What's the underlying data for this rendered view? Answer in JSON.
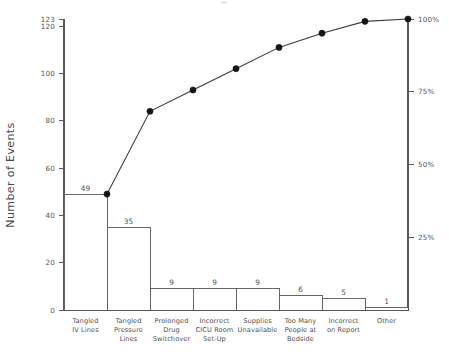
{
  "chart_data": {
    "type": "bar",
    "title": "",
    "subtitle": "",
    "xlabel": "",
    "ylabel": "Number of Events",
    "y2label": "",
    "categories": [
      "Tangled IV Lines",
      "Tangled Pressure Lines",
      "Prolonged Drug Switchover",
      "Incorrect CICU Room Set-Up",
      "Supplies Unavailable",
      "Too Many People at Bedside",
      "Incorrect on Report",
      "Other"
    ],
    "category_lines": [
      [
        "Tangled",
        "IV Lines"
      ],
      [
        "Tangled",
        "Pressure",
        "Lines"
      ],
      [
        "Prolonged",
        "Drug",
        "Switchover"
      ],
      [
        "Incorrect",
        "CICU Room",
        "Set-Up"
      ],
      [
        "Supplies",
        "Unavailable"
      ],
      [
        "Too Many",
        "People at",
        "Bedside"
      ],
      [
        "Incorrect",
        "on Report"
      ],
      [
        "Other"
      ]
    ],
    "values": [
      49,
      35,
      9,
      9,
      9,
      6,
      5,
      1
    ],
    "bar_value_labels": [
      "49",
      "35",
      "9",
      "9",
      "9",
      "6",
      "5",
      "1"
    ],
    "cumulative_values": [
      49,
      84,
      93,
      102,
      111,
      117,
      122,
      123
    ],
    "cumulative_percent": [
      39.8,
      68.3,
      75.6,
      82.9,
      90.2,
      95.1,
      99.2,
      100.0
    ],
    "total": 123,
    "ylim": [
      0,
      123
    ],
    "y_ticks": [
      0,
      20,
      40,
      60,
      80,
      100,
      120,
      123
    ],
    "y_tick_labels": [
      "0",
      "20",
      "40",
      "60",
      "80",
      "100",
      "120",
      "123"
    ],
    "y2lim": [
      0,
      100
    ],
    "y2_ticks": [
      25,
      50,
      75,
      100
    ],
    "y2_tick_labels": [
      "25%",
      "50%",
      "75%",
      "100%"
    ],
    "grid": false,
    "legend": "none",
    "series": [
      {
        "name": "Number of Events",
        "type": "bar",
        "values": [
          49,
          35,
          9,
          9,
          9,
          6,
          5,
          1
        ]
      },
      {
        "name": "Cumulative Percent",
        "type": "line",
        "values": [
          39.8,
          68.3,
          75.6,
          82.9,
          90.2,
          95.1,
          99.2,
          100.0
        ]
      }
    ],
    "colors": {
      "bar_fill": "#ffffff",
      "bar_stroke": "#555555",
      "line": "#3a3a3a",
      "marker": "#161616",
      "axis": "#5a5a5a",
      "text": "#4f4f4f"
    }
  },
  "axes": {
    "left_title": "Number of Events",
    "left_ticks": [
      {
        "label": "123",
        "value": 123
      },
      {
        "label": "120",
        "value": 120
      },
      {
        "label": "100",
        "value": 100
      },
      {
        "label": "80",
        "value": 80
      },
      {
        "label": "60",
        "value": 60
      },
      {
        "label": "40",
        "value": 40
      },
      {
        "label": "20",
        "value": 20
      },
      {
        "label": "0",
        "value": 0
      }
    ],
    "right_ticks": [
      {
        "label": "100%",
        "value": 100
      },
      {
        "label": "75%",
        "value": 75
      },
      {
        "label": "50%",
        "value": 50
      },
      {
        "label": "25%",
        "value": 25
      }
    ]
  },
  "bars": [
    {
      "label": "49",
      "value": 49,
      "cum": 49,
      "cum_pct": 39.8,
      "lines": [
        "Tangled",
        "IV Lines"
      ]
    },
    {
      "label": "35",
      "value": 35,
      "cum": 84,
      "cum_pct": 68.3,
      "lines": [
        "Tangled",
        "Pressure",
        "Lines"
      ]
    },
    {
      "label": "9",
      "value": 9,
      "cum": 93,
      "cum_pct": 75.6,
      "lines": [
        "Prolonged",
        "Drug",
        "Switchover"
      ]
    },
    {
      "label": "9",
      "value": 9,
      "cum": 102,
      "cum_pct": 82.9,
      "lines": [
        "Incorrect",
        "CICU Room",
        "Set-Up"
      ]
    },
    {
      "label": "9",
      "value": 9,
      "cum": 111,
      "cum_pct": 90.2,
      "lines": [
        "Supplies",
        "Unavailable"
      ]
    },
    {
      "label": "6",
      "value": 6,
      "cum": 117,
      "cum_pct": 95.1,
      "lines": [
        "Too Many",
        "People at",
        "Bedside"
      ]
    },
    {
      "label": "5",
      "value": 5,
      "cum": 122,
      "cum_pct": 99.2,
      "lines": [
        "Incorrect",
        "on Report"
      ]
    },
    {
      "label": "1",
      "value": 1,
      "cum": 123,
      "cum_pct": 100.0,
      "lines": [
        "Other"
      ]
    }
  ]
}
